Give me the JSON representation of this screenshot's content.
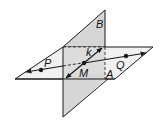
{
  "diagram": {
    "type": "intersecting-planes",
    "colors": {
      "plane_b_fill": "#d6d6d6",
      "plane_a_fill": "#ececec",
      "stroke": "#1a1a1a",
      "background": "#ffffff"
    },
    "labels": {
      "plane_b": "B",
      "plane_a": "A",
      "line_k": "k",
      "point_m": "M",
      "point_p": "P",
      "point_q": "Q"
    }
  }
}
